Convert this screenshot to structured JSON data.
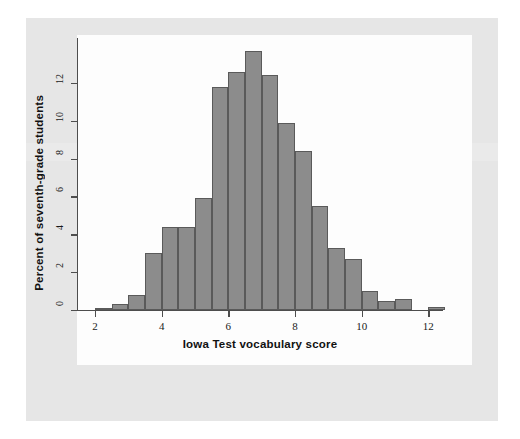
{
  "figure": {
    "background_color": "#e6e6e6",
    "plot_background_color": "#fdfdfd",
    "bar_fill_color": "#8c8c8c",
    "bar_edge_color": "#5a5a5a",
    "axis_color": "#4d4d4d"
  },
  "chart_data": {
    "type": "bar",
    "title": "",
    "xlabel": "Iowa Test vocabulary score",
    "ylabel": "Percent of seventh-grade students",
    "xlim": [
      1.5,
      13.0
    ],
    "ylim": [
      0,
      14.2
    ],
    "grid": false,
    "legend": null,
    "bin_width": 0.5,
    "xticks": [
      "2",
      "4",
      "6",
      "8",
      "10",
      "12"
    ],
    "xtick_values": [
      2,
      4,
      6,
      8,
      10,
      12
    ],
    "yticks": [
      "0",
      "2",
      "4",
      "6",
      "8",
      "10",
      "12"
    ],
    "ytick_values": [
      0,
      2,
      4,
      6,
      8,
      10,
      12
    ],
    "categories": [
      "2.0-2.5",
      "2.5-3.0",
      "3.0-3.5",
      "3.5-4.0",
      "4.0-4.5",
      "4.5-5.0",
      "5.0-5.5",
      "5.5-6.0",
      "6.0-6.5",
      "6.5-7.0",
      "7.0-7.5",
      "7.5-8.0",
      "8.0-8.5",
      "8.5-9.0",
      "9.0-9.5",
      "9.5-10.0",
      "10.0-10.5",
      "10.5-11.0",
      "11.0-11.5",
      "12.0-12.5"
    ],
    "bin_starts": [
      2.0,
      2.5,
      3.0,
      3.5,
      4.0,
      4.5,
      5.0,
      5.5,
      6.0,
      6.5,
      7.0,
      7.5,
      8.0,
      8.5,
      9.0,
      9.5,
      10.0,
      10.5,
      11.0,
      12.0
    ],
    "values": [
      0.1,
      0.3,
      0.8,
      3.0,
      4.4,
      4.4,
      5.9,
      11.8,
      12.6,
      13.7,
      12.4,
      9.9,
      8.4,
      5.5,
      3.3,
      2.7,
      1.0,
      0.5,
      0.6,
      0.15
    ]
  }
}
